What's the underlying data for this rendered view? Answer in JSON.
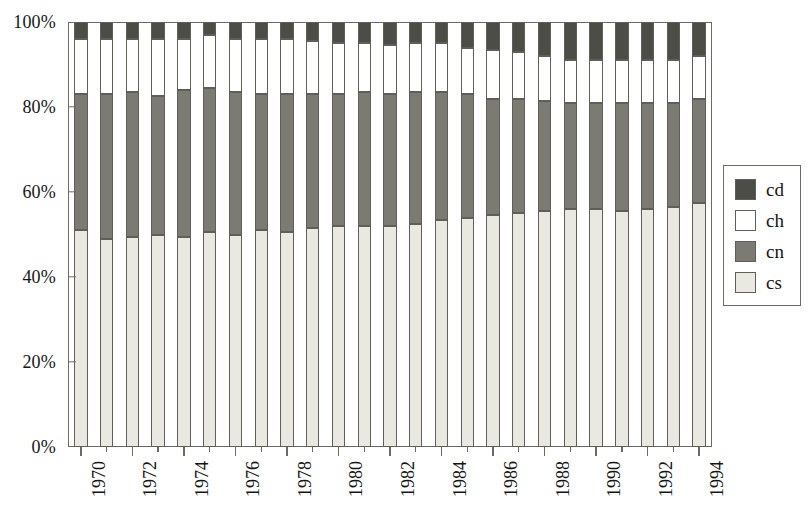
{
  "chart_data": {
    "type": "bar",
    "subtype": "stacked-percentage",
    "title": "",
    "xlabel": "",
    "ylabel": "",
    "ylim": [
      0,
      100
    ],
    "y_ticks": [
      0,
      20,
      40,
      60,
      80,
      100
    ],
    "y_tick_labels": [
      "0%",
      "20%",
      "40%",
      "60%",
      "80%",
      "100%"
    ],
    "grid": false,
    "legend_position": "right",
    "stack_order_bottom_to_top": [
      "cs",
      "cn",
      "ch",
      "cd"
    ],
    "categories": [
      "1970",
      "1971",
      "1972",
      "1973",
      "1974",
      "1975",
      "1976",
      "1977",
      "1978",
      "1979",
      "1980",
      "1981",
      "1982",
      "1983",
      "1984",
      "1985",
      "1986",
      "1987",
      "1988",
      "1989",
      "1990",
      "1991",
      "1992",
      "1993",
      "1994"
    ],
    "x_tick_labels": [
      "1970",
      "1972",
      "1974",
      "1976",
      "1978",
      "1980",
      "1982",
      "1984",
      "1986",
      "1988",
      "1990",
      "1992",
      "1994"
    ],
    "series": [
      {
        "name": "cs",
        "color": "#e9e9e1",
        "values": [
          51.0,
          49.0,
          49.5,
          50.0,
          49.5,
          50.5,
          50.0,
          51.0,
          50.5,
          51.5,
          52.0,
          52.0,
          52.0,
          52.5,
          53.5,
          54.0,
          54.5,
          55.0,
          55.5,
          56.0,
          56.0,
          55.5,
          56.0,
          56.5,
          57.5
        ]
      },
      {
        "name": "cn",
        "color": "#7b7b74",
        "values": [
          32.0,
          34.0,
          34.0,
          32.5,
          34.5,
          34.0,
          33.5,
          32.0,
          32.5,
          31.5,
          31.0,
          31.5,
          31.0,
          31.0,
          30.0,
          29.0,
          27.5,
          27.0,
          26.0,
          25.0,
          25.0,
          25.5,
          25.0,
          24.5,
          24.5
        ]
      },
      {
        "name": "ch",
        "color": "#ffffff",
        "values": [
          13.0,
          13.0,
          12.5,
          13.5,
          12.0,
          12.5,
          12.5,
          13.0,
          13.0,
          12.5,
          12.0,
          11.5,
          11.5,
          11.5,
          11.5,
          11.0,
          11.5,
          11.0,
          10.5,
          10.0,
          10.0,
          10.0,
          10.0,
          10.0,
          10.0
        ]
      },
      {
        "name": "cd",
        "color": "#4d4d48",
        "values": [
          4.0,
          4.0,
          4.0,
          4.0,
          4.0,
          3.0,
          4.0,
          4.0,
          4.0,
          4.5,
          5.0,
          5.0,
          5.5,
          5.0,
          5.0,
          6.0,
          6.5,
          7.0,
          8.0,
          9.0,
          9.0,
          9.0,
          9.0,
          9.0,
          8.0
        ]
      }
    ],
    "legend_entries": [
      {
        "label": "cd",
        "color": "#4d4d48"
      },
      {
        "label": "ch",
        "color": "#ffffff"
      },
      {
        "label": "cn",
        "color": "#7b7b74"
      },
      {
        "label": "cs",
        "color": "#e9e9e1"
      }
    ]
  }
}
